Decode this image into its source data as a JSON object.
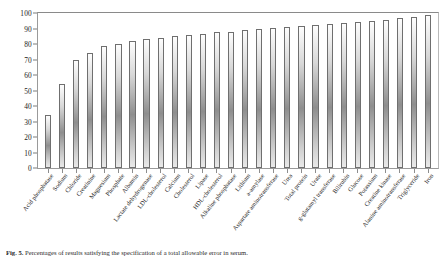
{
  "figure": {
    "caption_label": "Fig. 5.",
    "caption_text": "Percentages of results satisfying the specification of a total allowable error in serum."
  },
  "chart_data": {
    "type": "bar",
    "title": "",
    "xlabel": "",
    "ylabel": "",
    "ylim": [
      0,
      100
    ],
    "ytick_step": 10,
    "grid": false,
    "legend": "none",
    "bar_fill": "#a8a8a8",
    "bar_edge": "#6f6f6f",
    "yticks": [
      0,
      10,
      20,
      30,
      40,
      50,
      60,
      70,
      80,
      90,
      100
    ],
    "categories": [
      "Acid phosphatase",
      "Sodium",
      "Chloride",
      "Creatinine",
      "Magnesium",
      "Phosphate",
      "Albumin",
      "Lactate dehydrogenase",
      "LDL-cholesterol",
      "Calcium",
      "Cholesterol",
      "Lipase",
      "HDL-cholesterol",
      "Alkaline phosphatase",
      "Lithium",
      "a-amylase",
      "Aspartate aminotransferase",
      "Urea",
      "Total protein",
      "Urate",
      "g-glutamyl transferase",
      "Bilirubin",
      "Glucose",
      "Potassium",
      "Creatine kinase",
      "Alanine aminotransferase",
      "Triglyceride",
      "Iron"
    ],
    "values": [
      34,
      54,
      70,
      74,
      78.5,
      80,
      82,
      83,
      84,
      85,
      85.5,
      86.5,
      87.5,
      88,
      89,
      90,
      90.5,
      91,
      91.5,
      92,
      93,
      93.5,
      94,
      95,
      95.5,
      96.5,
      97.5,
      99
    ]
  }
}
